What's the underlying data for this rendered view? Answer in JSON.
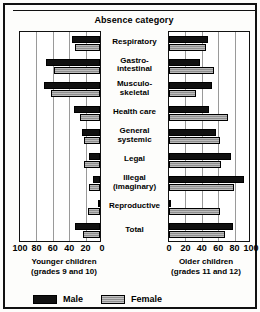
{
  "chart_data": {
    "type": "bar",
    "title": "Absence category",
    "orientation": "horizontal-bidirectional",
    "categories": [
      "Respiratory",
      "Gastro-\nintestinal",
      "Musculo-\nskeletal",
      "Health care",
      "General\nsystemic",
      "Legal",
      "Illegal\n(imaginary)",
      "Reproductive",
      "Total"
    ],
    "panels": [
      {
        "name": "younger",
        "caption": "Younger children\n(grades 9 and 10)",
        "axis_direction": "reversed",
        "xlim": [
          0,
          100
        ],
        "ticks": [
          100,
          80,
          60,
          40,
          20,
          0
        ],
        "series": [
          {
            "name": "Male",
            "values": [
              34,
              66,
              68,
              32,
              22,
              14,
              9,
              3,
              30
            ]
          },
          {
            "name": "Female",
            "values": [
              30,
              56,
              60,
              24,
              19,
              20,
              14,
              15,
              21
            ]
          }
        ]
      },
      {
        "name": "older",
        "caption": "Older children\n(grades 11 and 12)",
        "axis_direction": "normal",
        "xlim": [
          0,
          100
        ],
        "ticks": [
          0,
          20,
          40,
          60,
          80,
          100
        ],
        "series": [
          {
            "name": "Male",
            "values": [
              48,
              38,
              53,
              49,
              57,
              75,
              92,
              2,
              78
            ]
          },
          {
            "name": "Female",
            "values": [
              45,
              55,
              33,
              72,
              62,
              64,
              79,
              62,
              68
            ]
          }
        ]
      }
    ],
    "legend": {
      "position": "bottom-left",
      "entries": [
        {
          "label": "Male",
          "color": "#111111"
        },
        {
          "label": "Female",
          "color": "#a8a8a8"
        }
      ]
    },
    "grid": true
  },
  "legend_labels": {
    "male": "Male",
    "female": "Female"
  },
  "tick_labels": {
    "left": [
      "100",
      "80",
      "60",
      "40",
      "20",
      "0"
    ],
    "right": [
      "0",
      "20",
      "40",
      "60",
      "80",
      "100"
    ]
  },
  "captions": {
    "left_line1": "Younger children",
    "left_line2": "(grades 9 and 10)",
    "right_line1": "Older children",
    "right_line2": "(grades 11 and 12)"
  },
  "category_labels": [
    {
      "line1": "Respiratory",
      "line2": ""
    },
    {
      "line1": "Gastro-",
      "line2": "intestinal"
    },
    {
      "line1": "Musculo-",
      "line2": "skeletal"
    },
    {
      "line1": "Health care",
      "line2": ""
    },
    {
      "line1": "General",
      "line2": "systemic"
    },
    {
      "line1": "Legal",
      "line2": ""
    },
    {
      "line1": "Illegal",
      "line2": "(imaginary)"
    },
    {
      "line1": "Reproductive",
      "line2": ""
    },
    {
      "line1": "Total",
      "line2": ""
    }
  ]
}
